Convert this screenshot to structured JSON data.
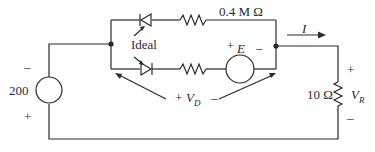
{
  "diagram": {
    "type": "circuit",
    "source_left": {
      "value": "200",
      "minus": "–",
      "plus": "+"
    },
    "top_branch": {
      "resistor_label": "0.4 M Ω"
    },
    "diode_note": "Ideal",
    "bottom_branch": {
      "source_label": "E",
      "plus": "+",
      "minus": "–"
    },
    "vd_label": {
      "plus": "+",
      "symbol": "V",
      "sub": "D",
      "minus": "–"
    },
    "current": {
      "symbol": "I"
    },
    "load": {
      "resistor_label": "10 Ω",
      "plus": "+",
      "symbol": "V",
      "sub": "R",
      "minus": "–"
    },
    "colors": {
      "stroke": "#2a2a2a",
      "background": "#ffffff"
    }
  }
}
